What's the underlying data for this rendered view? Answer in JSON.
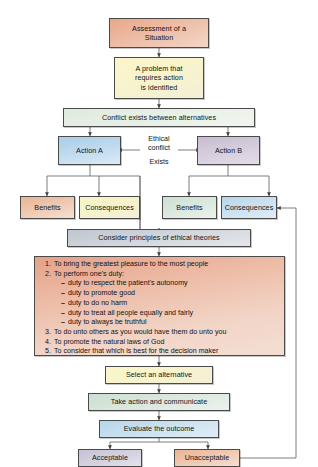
{
  "diagram": {
    "nodes": {
      "assessment": "Assessment of a\nSituation",
      "problem": "A problem that\nrequires action\nis identified",
      "conflict": "Conflict exists between alternatives",
      "action_a": "Action A",
      "action_b": "Action B",
      "benefits_a": "Benefits",
      "consequences_a": "Consequences",
      "benefits_b": "Benefits",
      "consequences_b": "Consequences",
      "consider": "Consider principles of ethical theories",
      "select": "Select an alternative",
      "take_action": "Take action and communicate",
      "evaluate": "Evaluate the outcome",
      "acceptable": "Acceptable",
      "unacceptable": "Unacceptable"
    },
    "edge_labels": {
      "ethical_conflict": "Ethical\nconflict",
      "exists": "Exists"
    },
    "principles": [
      {
        "text": "To bring the greatest pleasure to the most people",
        "sub": []
      },
      {
        "text": "To perform one's duty:",
        "sub": [
          "duty to respect the patient's autonomy",
          "duty to promote good",
          "duty to do no harm",
          "duty to treat all people equally and fairly",
          "duty to always be truthful"
        ]
      },
      {
        "text": "To do unto others as you would have them do unto you",
        "sub": []
      },
      {
        "text": "To promote the natural laws of God",
        "sub": []
      },
      {
        "text": "To consider that which is best for the decision maker",
        "sub": []
      }
    ],
    "colors": {
      "stroke": "#4a4a4a",
      "salmon": "#e8a889",
      "yellow": "#fbf6c8",
      "green": "#dfeadf",
      "blue": "#a9cde8",
      "mauve": "#c8bcd0",
      "grey": "#c9c9d4"
    }
  }
}
